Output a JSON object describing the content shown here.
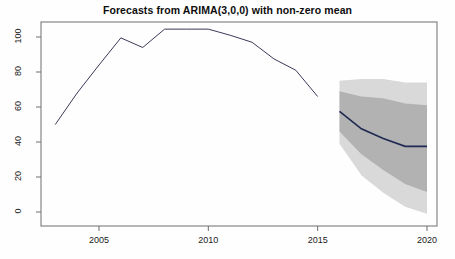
{
  "chart_data": {
    "type": "line",
    "title": "Forecasts from ARIMA(3,0,0) with non-zero mean",
    "xlabel": "",
    "ylabel": "",
    "xlim": [
      2002.6,
      2020.5
    ],
    "ylim": [
      -3,
      108
    ],
    "grid": false,
    "legend": false,
    "axis": {
      "x_ticks": [
        2005,
        2010,
        2015,
        2020
      ],
      "x_tick_labels": [
        "2005",
        "2010",
        "2015",
        "2020"
      ],
      "y_ticks": [
        0,
        20,
        40,
        60,
        80,
        100
      ],
      "y_tick_labels": [
        "0",
        "20",
        "40",
        "60",
        "80",
        "100"
      ]
    },
    "series": [
      {
        "name": "historical",
        "kind": "line",
        "color": "#3a3a5a",
        "x": [
          2003,
          2004,
          2005,
          2006,
          2007,
          2008,
          2009,
          2010,
          2011,
          2012,
          2013,
          2014,
          2015
        ],
        "values": [
          50,
          68,
          84,
          99.5,
          94,
          104.5,
          104.5,
          104.5,
          101,
          97,
          87.5,
          81,
          66
        ]
      },
      {
        "name": "point-forecast",
        "kind": "line",
        "color": "#1f2a52",
        "x": [
          2016,
          2017,
          2018,
          2019,
          2020
        ],
        "values": [
          57.5,
          47.5,
          42,
          37.5,
          37.5
        ]
      }
    ],
    "intervals": [
      {
        "name": "80% prediction interval",
        "level": 80,
        "color": "#b2b2b2",
        "x": [
          2016,
          2017,
          2018,
          2019,
          2020
        ],
        "lower": [
          46,
          33,
          24,
          16,
          11.5
        ],
        "upper": [
          69,
          66,
          65,
          62,
          61
        ]
      },
      {
        "name": "95% prediction interval",
        "level": 95,
        "color": "#d9d9d9",
        "x": [
          2016,
          2017,
          2018,
          2019,
          2020
        ],
        "lower": [
          39,
          21,
          11,
          3,
          -1
        ],
        "upper": [
          75,
          76,
          76,
          74,
          74
        ]
      }
    ],
    "colors": {
      "line_historical": "#3a3a5a",
      "line_forecast": "#1f2a52",
      "band_80": "#b2b2b2",
      "band_95": "#d9d9d9",
      "axis": "#6e6e6e",
      "background": "#fefefe",
      "text": "#111111"
    }
  }
}
